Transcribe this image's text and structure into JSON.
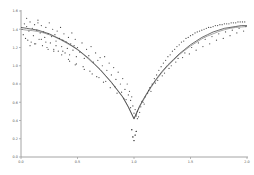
{
  "chart_data": {
    "type": "scatter",
    "title": "",
    "subtitle": "",
    "xlabel": "",
    "ylabel": "",
    "xlim": [
      0.0,
      2.0
    ],
    "ylim": [
      0.0,
      1.6
    ],
    "grid": false,
    "legend": "none",
    "xticks": [
      0.0,
      0.5,
      1.0,
      1.5,
      2.0
    ],
    "xtick_labels": [
      "0.0",
      "0.5",
      "1.0",
      "1.5",
      "2.0"
    ],
    "yticks": [
      0.0,
      0.2,
      0.4,
      0.6,
      0.8,
      1.0,
      1.2,
      1.4,
      1.6
    ],
    "ytick_labels": [
      "0.0",
      "0.2",
      "0.4",
      "0.6",
      "0.8",
      "1.0",
      "1.2",
      "1.4",
      "1.6"
    ],
    "marker": "point",
    "marker_color": "#4a4a4a",
    "series": [
      {
        "name": "observations",
        "type": "scatter",
        "x": [
          0.01,
          0.02,
          0.03,
          0.04,
          0.05,
          0.06,
          0.07,
          0.08,
          0.09,
          0.1,
          0.11,
          0.12,
          0.13,
          0.14,
          0.15,
          0.16,
          0.17,
          0.18,
          0.19,
          0.2,
          0.21,
          0.22,
          0.23,
          0.24,
          0.25,
          0.26,
          0.27,
          0.28,
          0.29,
          0.3,
          0.31,
          0.32,
          0.33,
          0.34,
          0.35,
          0.36,
          0.37,
          0.38,
          0.39,
          0.4,
          0.41,
          0.42,
          0.43,
          0.44,
          0.45,
          0.46,
          0.47,
          0.48,
          0.49,
          0.5,
          0.52,
          0.54,
          0.56,
          0.58,
          0.6,
          0.62,
          0.64,
          0.66,
          0.68,
          0.7,
          0.72,
          0.74,
          0.76,
          0.78,
          0.8,
          0.82,
          0.84,
          0.86,
          0.88,
          0.9,
          0.92,
          0.94,
          0.95,
          0.96,
          0.97,
          0.98,
          0.99,
          1.0,
          1.01,
          1.02,
          1.03,
          1.04,
          1.05,
          1.06,
          1.08,
          1.1,
          1.12,
          1.14,
          1.16,
          1.18,
          1.2,
          1.22,
          1.24,
          1.26,
          1.28,
          1.3,
          1.32,
          1.34,
          1.36,
          1.38,
          1.4,
          1.42,
          1.44,
          1.46,
          1.48,
          1.5,
          1.52,
          1.54,
          1.56,
          1.58,
          1.6,
          1.62,
          1.64,
          1.66,
          1.68,
          1.7,
          1.72,
          1.74,
          1.76,
          1.78,
          1.8,
          1.82,
          1.84,
          1.86,
          1.88,
          1.9,
          1.92,
          1.94,
          1.96,
          1.98,
          0.05,
          0.12,
          0.18,
          0.24,
          0.31,
          0.37,
          0.43,
          0.49,
          0.55,
          0.61,
          0.67,
          0.73,
          0.79,
          0.85,
          0.91,
          0.97,
          1.03,
          1.09,
          1.15,
          1.21,
          1.27,
          1.33,
          1.39,
          1.45,
          1.51,
          1.57,
          1.63,
          1.69,
          1.75,
          1.81,
          1.87,
          1.93,
          1.99,
          0.08,
          0.15,
          0.22,
          0.29,
          0.36,
          0.42,
          0.48,
          0.56,
          0.63,
          0.69,
          0.75,
          0.83,
          0.89,
          0.93,
          1.02,
          1.07,
          1.13,
          1.19,
          1.25,
          1.31,
          1.37,
          1.43,
          1.49,
          1.55,
          1.61,
          1.67,
          1.73,
          1.79,
          1.85,
          1.91,
          1.97,
          0.99,
          1.0,
          1.01,
          0.98,
          1.02
        ],
        "y": [
          1.4,
          1.34,
          1.46,
          1.3,
          1.43,
          1.28,
          1.38,
          1.48,
          1.26,
          1.41,
          1.33,
          1.45,
          1.24,
          1.39,
          1.5,
          1.29,
          1.36,
          1.44,
          1.22,
          1.37,
          1.31,
          1.42,
          1.2,
          1.35,
          1.47,
          1.25,
          1.32,
          1.4,
          1.18,
          1.34,
          1.27,
          1.38,
          1.16,
          1.3,
          1.42,
          1.21,
          1.28,
          1.35,
          1.14,
          1.26,
          1.19,
          1.31,
          1.12,
          1.24,
          1.36,
          1.17,
          1.22,
          1.29,
          1.1,
          1.2,
          1.15,
          1.25,
          1.08,
          1.18,
          1.11,
          1.21,
          1.04,
          1.14,
          1.06,
          1.09,
          1.0,
          1.1,
          0.95,
          1.03,
          0.9,
          0.98,
          0.85,
          0.93,
          0.8,
          0.86,
          0.74,
          0.8,
          0.68,
          0.72,
          0.62,
          0.66,
          0.56,
          0.48,
          0.52,
          0.45,
          0.5,
          0.44,
          0.49,
          0.55,
          0.6,
          0.66,
          0.7,
          0.76,
          0.8,
          0.86,
          0.9,
          0.95,
          0.99,
          1.03,
          1.06,
          1.1,
          1.12,
          1.16,
          1.18,
          1.21,
          1.23,
          1.26,
          1.27,
          1.3,
          1.31,
          1.33,
          1.34,
          1.36,
          1.37,
          1.38,
          1.39,
          1.4,
          1.41,
          1.42,
          1.42,
          1.43,
          1.44,
          1.44,
          1.45,
          1.45,
          1.46,
          1.46,
          1.46,
          1.47,
          1.47,
          1.47,
          1.48,
          1.48,
          1.48,
          1.48,
          1.52,
          1.24,
          1.29,
          1.18,
          1.22,
          1.16,
          1.05,
          1.02,
          0.99,
          0.94,
          0.88,
          0.82,
          0.76,
          0.7,
          0.64,
          0.54,
          0.42,
          0.58,
          0.72,
          0.84,
          0.92,
          1.0,
          1.08,
          1.14,
          1.2,
          1.25,
          1.29,
          1.32,
          1.35,
          1.37,
          1.39,
          1.41,
          1.43,
          1.22,
          1.47,
          1.26,
          1.16,
          1.12,
          1.07,
          1.01,
          0.96,
          0.91,
          0.87,
          0.83,
          0.77,
          0.71,
          0.63,
          0.47,
          0.61,
          0.73,
          0.81,
          0.89,
          0.97,
          1.04,
          1.09,
          1.13,
          1.17,
          1.21,
          1.24,
          1.28,
          1.3,
          1.33,
          1.36,
          1.38,
          0.22,
          0.18,
          0.24,
          0.3,
          0.28
        ]
      },
      {
        "name": "model-fit-primary",
        "type": "line",
        "x": [
          0.0,
          0.05,
          0.1,
          0.15,
          0.2,
          0.25,
          0.3,
          0.35,
          0.4,
          0.45,
          0.5,
          0.55,
          0.6,
          0.65,
          0.7,
          0.75,
          0.8,
          0.85,
          0.9,
          0.95,
          1.0,
          1.05,
          1.1,
          1.15,
          1.2,
          1.25,
          1.3,
          1.35,
          1.4,
          1.45,
          1.5,
          1.55,
          1.6,
          1.65,
          1.7,
          1.75,
          1.8,
          1.85,
          1.9,
          1.95,
          2.0
        ],
        "y": [
          1.42,
          1.41,
          1.4,
          1.39,
          1.37,
          1.35,
          1.32,
          1.29,
          1.26,
          1.22,
          1.18,
          1.13,
          1.08,
          1.02,
          0.96,
          0.89,
          0.82,
          0.74,
          0.66,
          0.55,
          0.42,
          0.56,
          0.67,
          0.77,
          0.86,
          0.94,
          1.01,
          1.07,
          1.13,
          1.18,
          1.23,
          1.27,
          1.31,
          1.34,
          1.37,
          1.39,
          1.41,
          1.42,
          1.43,
          1.44,
          1.44
        ]
      },
      {
        "name": "model-fit-secondary",
        "type": "line",
        "x": [
          0.0,
          0.05,
          0.1,
          0.15,
          0.2,
          0.25,
          0.3,
          0.35,
          0.4,
          0.45,
          0.5,
          0.55,
          0.6,
          0.65,
          0.7,
          0.75,
          0.8,
          0.85,
          0.9,
          0.95,
          1.0,
          1.05,
          1.1,
          1.15,
          1.2,
          1.25,
          1.3,
          1.35,
          1.4,
          1.45,
          1.5,
          1.55,
          1.6,
          1.65,
          1.7,
          1.75,
          1.8,
          1.85,
          1.9,
          1.95,
          2.0
        ],
        "y": [
          1.4,
          1.39,
          1.385,
          1.375,
          1.36,
          1.34,
          1.315,
          1.285,
          1.25,
          1.215,
          1.175,
          1.125,
          1.07,
          1.015,
          0.955,
          0.885,
          0.815,
          0.735,
          0.655,
          0.545,
          0.415,
          0.55,
          0.66,
          0.76,
          0.85,
          0.93,
          1.0,
          1.06,
          1.12,
          1.17,
          1.215,
          1.255,
          1.295,
          1.325,
          1.35,
          1.375,
          1.395,
          1.41,
          1.42,
          1.425,
          1.43
        ]
      }
    ],
    "minimum_point": {
      "x": 1.0,
      "y": 0.42
    },
    "outliers": [
      {
        "x": 0.99,
        "y": 0.22
      },
      {
        "x": 1.0,
        "y": 0.18
      },
      {
        "x": 1.01,
        "y": 0.24
      },
      {
        "x": 0.98,
        "y": 0.3
      },
      {
        "x": 1.02,
        "y": 0.28
      }
    ],
    "colors": {
      "marker": "#4a4a4a",
      "fit_primary": "#3a3a3a",
      "fit_secondary": "#6a6a6a",
      "axis": "#9a9a9a",
      "tick_text": "#555555",
      "background": "#ffffff"
    }
  },
  "figure": {
    "background": "#ffffff",
    "plot_left_px": 21,
    "plot_right_px": 247,
    "plot_top_px": 11,
    "plot_bottom_px": 157
  }
}
